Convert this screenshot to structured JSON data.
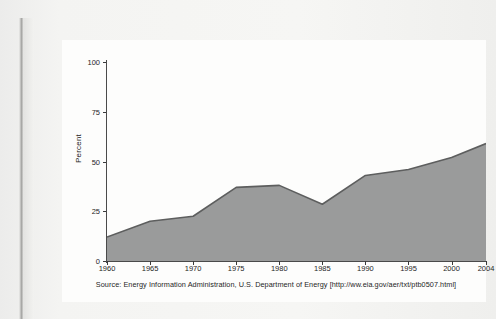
{
  "figure": {
    "source_note": "Source: Energy Information Administration, U.S. Department of Energy [http://ww.eia.gov/aer/txt/ptb0507.html]"
  },
  "chart_data": {
    "type": "area",
    "title": "",
    "subtitle": "",
    "xlabel": "",
    "ylabel": "Percent",
    "xlim": [
      1960,
      2004
    ],
    "ylim": [
      0,
      100
    ],
    "grid": false,
    "legend": null,
    "x_tick_labels": [
      "1960",
      "1965",
      "1970",
      "1975",
      "1980",
      "1985",
      "1990",
      "1995",
      "2000",
      "2004"
    ],
    "x_ticks": [
      1960,
      1965,
      1970,
      1975,
      1980,
      1985,
      1990,
      1995,
      2000,
      2004
    ],
    "y_tick_labels": [
      "0",
      "25",
      "50",
      "75",
      "100"
    ],
    "y_ticks": [
      0,
      25,
      50,
      75,
      100
    ],
    "x": [
      1960,
      1965,
      1970,
      1975,
      1980,
      1985,
      1990,
      1995,
      2000,
      2004
    ],
    "values": [
      12,
      20,
      22.5,
      37,
      38,
      28.5,
      43,
      46,
      52,
      59
    ],
    "series": [
      {
        "name": "Percent",
        "x": [
          1960,
          1965,
          1970,
          1975,
          1980,
          1985,
          1990,
          1995,
          2000,
          2004
        ],
        "values": [
          12,
          20,
          22.5,
          37,
          38,
          28.5,
          43,
          46,
          52,
          59
        ]
      }
    ],
    "colors": {
      "area_fill": "#9a9b9b",
      "area_line": "#5d5e5e",
      "axis": "#4a4a4a",
      "text": "#1f1f1f",
      "card_background": "#fdfdfc",
      "page_background": "#f2f2f0"
    }
  }
}
